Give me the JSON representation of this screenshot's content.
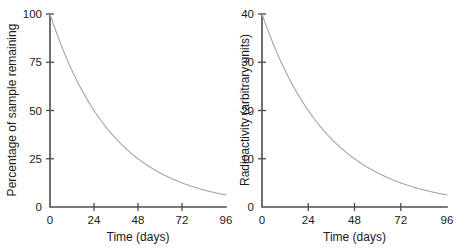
{
  "figure": {
    "background": "#ffffff",
    "curve_color": "#a8a8a8",
    "axis_color": "#4d4d4d",
    "text_color": "#1a1a1a"
  },
  "chart_data": [
    {
      "type": "line",
      "title": "",
      "xlabel": "Time (days)",
      "ylabel": "Percentage of sample remaining",
      "xlim": [
        0,
        96
      ],
      "ylim": [
        0,
        100
      ],
      "xticks": [
        0,
        24,
        48,
        72,
        96
      ],
      "xtick_labels": [
        "0",
        "24",
        "48",
        "72",
        "96"
      ],
      "yticks": [
        0,
        25,
        50,
        75,
        100
      ],
      "ytick_labels": [
        "0",
        "25",
        "50",
        "75",
        "100"
      ],
      "grid": false,
      "legend": "none",
      "half_life_days": 24,
      "x": [
        0,
        4,
        8,
        12,
        16,
        20,
        24,
        28,
        32,
        36,
        40,
        44,
        48,
        52,
        56,
        60,
        64,
        68,
        72,
        76,
        80,
        84,
        88,
        92,
        96
      ],
      "values": [
        100,
        89.1,
        79.4,
        70.7,
        63,
        56.1,
        50,
        44.5,
        39.7,
        35.4,
        31.5,
        28.1,
        25,
        22.3,
        19.8,
        17.7,
        15.7,
        14,
        12.5,
        11.1,
        9.9,
        8.8,
        7.9,
        7,
        6.3
      ]
    },
    {
      "type": "line",
      "title": "",
      "xlabel": "Time (days)",
      "ylabel": "Radioactivity (arbitrary units)",
      "xlim": [
        0,
        96
      ],
      "ylim": [
        0,
        40
      ],
      "xticks": [
        0,
        24,
        48,
        72,
        96
      ],
      "xtick_labels": [
        "0",
        "24",
        "48",
        "72",
        "96"
      ],
      "yticks": [
        0,
        10,
        20,
        30,
        40
      ],
      "ytick_labels": [
        "0",
        "10",
        "20",
        "30",
        "40"
      ],
      "grid": false,
      "legend": "none",
      "half_life_days": 24,
      "x": [
        0,
        4,
        8,
        12,
        16,
        20,
        24,
        28,
        32,
        36,
        40,
        44,
        48,
        52,
        56,
        60,
        64,
        68,
        72,
        76,
        80,
        84,
        88,
        92,
        96
      ],
      "values": [
        40,
        35.6,
        31.7,
        28.3,
        25.2,
        22.4,
        20,
        17.8,
        15.9,
        14.1,
        12.6,
        11.2,
        10,
        8.9,
        7.9,
        7.1,
        6.3,
        5.6,
        5,
        4.5,
        4,
        3.5,
        3.1,
        2.8,
        2.5
      ]
    }
  ]
}
